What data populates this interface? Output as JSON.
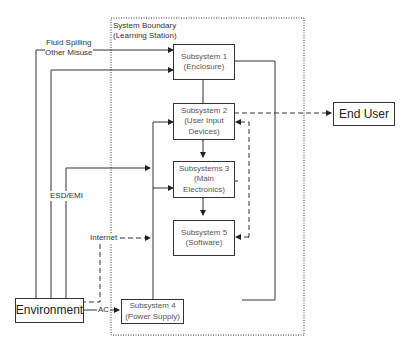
{
  "boundary": {
    "line1": "System Boundary",
    "line2": "(Learning Station)"
  },
  "boxes": {
    "s1": {
      "line1": "Subsystem 1",
      "line2": "(Enclosure)"
    },
    "s2": {
      "line1": "Subsystem 2",
      "line2": "(User Input",
      "line3": "Devices)"
    },
    "s3": {
      "line1": "Subsystems 3",
      "line2": "(Main",
      "line3": "Electronics)"
    },
    "s5": {
      "line1": "Subsystem 5",
      "line2": "(Software)"
    },
    "s4": {
      "line1": "Subsystem 4",
      "line2": "(Power Supply)"
    },
    "end_user": {
      "label": "End User"
    },
    "environment": {
      "label": "Environment"
    }
  },
  "labels": {
    "fluid": "Fluid Spilling",
    "misuse": "Other Misuse",
    "esd": "ESD/EMI",
    "internet": "Internet",
    "ac": "AC"
  }
}
